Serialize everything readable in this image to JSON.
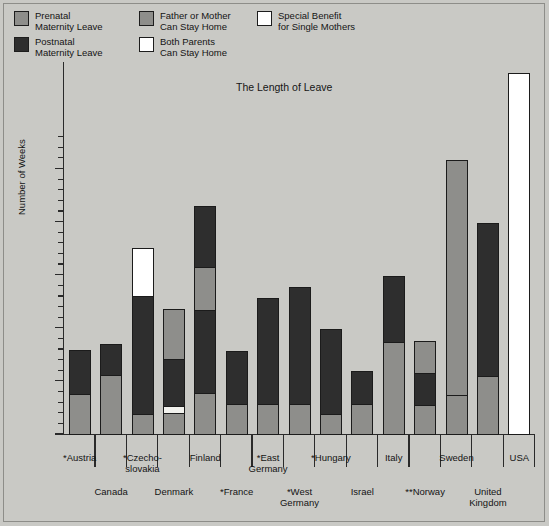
{
  "legend": {
    "items": [
      {
        "id": "prenatal",
        "label_line1": "Prenatal",
        "label_line2": "Maternity Leave",
        "color": "#8e8e8b"
      },
      {
        "id": "postnatal",
        "label_line1": "Postnatal",
        "label_line2": "Maternity Leave",
        "color": "#2e2e2e"
      },
      {
        "id": "father",
        "label_line1": "Father or Mother",
        "label_line2": "Can Stay Home",
        "color": "#8e8e8b"
      },
      {
        "id": "both",
        "label_line1": "Both Parents",
        "label_line2": "Can Stay Home",
        "color": "#ffffff"
      },
      {
        "id": "special",
        "label_line1": "Special Benefit",
        "label_line2": "for Single Mothers",
        "color": "#ffffff"
      }
    ]
  },
  "chart_data": {
    "type": "bar",
    "title": "The Length of Leave",
    "xlabel": "",
    "ylabel": "Number of Weeks",
    "ylim": [
      0,
      70
    ],
    "ytick_labels": [
      "0",
      "10",
      "20",
      "30",
      "40",
      "50"
    ],
    "ytick_values": [
      0,
      10,
      20,
      30,
      40,
      50
    ],
    "ytick_minor_step": 2,
    "grid": false,
    "legend_position": "top-left",
    "stacked": true,
    "series": [
      {
        "name": "Prenatal Maternity Leave",
        "key": "prenatal",
        "color": "#8e8e8b"
      },
      {
        "name": "Postnatal Maternity Leave",
        "key": "postnatal",
        "color": "#2e2e2e"
      },
      {
        "name": "Father or Mother Can Stay Home",
        "key": "father",
        "color": "#8e8e8b"
      },
      {
        "name": "Both Parents Can Stay Home",
        "key": "both",
        "color": "#f2f2ee"
      },
      {
        "name": "Special Benefit for Single Mothers",
        "key": "special",
        "color": "#ffffff"
      }
    ],
    "categories": [
      "*Austria",
      "Canada",
      "*Czecho-slovakia",
      "Denmark",
      "Finland",
      "*France",
      "*East Germany",
      "*West Germany",
      "*Hungary",
      "Israel",
      "**Norway",
      "Italy",
      "Sweden",
      "United Kingdom",
      "USA"
    ],
    "bars": [
      {
        "label_line1": "*Austria",
        "label_line2": "",
        "row": "up",
        "total": 15.8,
        "segments": [
          {
            "key": "prenatal",
            "from": 0,
            "to": 7.7
          },
          {
            "key": "postnatal",
            "from": 7.7,
            "to": 15.8
          }
        ]
      },
      {
        "label_line1": "Canada",
        "label_line2": "",
        "row": "down",
        "total": 17,
        "segments": [
          {
            "key": "prenatal",
            "from": 0,
            "to": 11.2
          },
          {
            "key": "postnatal",
            "from": 11.2,
            "to": 17
          }
        ]
      },
      {
        "label_line1": "*Czecho-",
        "label_line2": "slovakia",
        "row": "up",
        "total": 35,
        "segments": [
          {
            "key": "prenatal",
            "from": 0,
            "to": 3.8
          },
          {
            "key": "postnatal",
            "from": 3.8,
            "to": 26
          },
          {
            "key": "special",
            "from": 26,
            "to": 35
          }
        ]
      },
      {
        "label_line1": "Denmark",
        "label_line2": "",
        "row": "down",
        "total": 23.5,
        "segments": [
          {
            "key": "prenatal",
            "from": 0,
            "to": 4
          },
          {
            "key": "both",
            "from": 4,
            "to": 5.4
          },
          {
            "key": "postnatal",
            "from": 5.4,
            "to": 14.2
          },
          {
            "key": "father",
            "from": 14.2,
            "to": 23.5
          }
        ]
      },
      {
        "label_line1": "Finland",
        "label_line2": "",
        "row": "up",
        "total": 43,
        "segments": [
          {
            "key": "prenatal",
            "from": 0,
            "to": 7.8
          },
          {
            "key": "postnatal",
            "from": 7.8,
            "to": 23.5
          },
          {
            "key": "father",
            "from": 23.5,
            "to": 31.6
          },
          {
            "key": "postnatal",
            "from": 31.6,
            "to": 43
          }
        ]
      },
      {
        "label_line1": "*France",
        "label_line2": "",
        "row": "down",
        "total": 15.6,
        "segments": [
          {
            "key": "prenatal",
            "from": 0,
            "to": 5.8
          },
          {
            "key": "postnatal",
            "from": 5.8,
            "to": 15.6
          }
        ]
      },
      {
        "label_line1": "*East",
        "label_line2": "Germany",
        "row": "up",
        "total": 25.7,
        "segments": [
          {
            "key": "prenatal",
            "from": 0,
            "to": 5.7
          },
          {
            "key": "postnatal",
            "from": 5.7,
            "to": 25.7
          }
        ]
      },
      {
        "label_line1": "*West",
        "label_line2": "Germany",
        "row": "down",
        "total": 27.6,
        "segments": [
          {
            "key": "prenatal",
            "from": 0,
            "to": 5.7
          },
          {
            "key": "postnatal",
            "from": 5.7,
            "to": 27.6
          }
        ]
      },
      {
        "label_line1": "*Hungary",
        "label_line2": "",
        "row": "up",
        "total": 19.8,
        "segments": [
          {
            "key": "prenatal",
            "from": 0,
            "to": 3.9
          },
          {
            "key": "postnatal",
            "from": 3.9,
            "to": 19.8
          }
        ]
      },
      {
        "label_line1": "Israel",
        "label_line2": "",
        "row": "down",
        "total": 11.8,
        "segments": [
          {
            "key": "prenatal",
            "from": 0,
            "to": 5.7
          },
          {
            "key": "postnatal",
            "from": 5.7,
            "to": 11.8
          }
        ]
      },
      {
        "label_line1": "Italy",
        "label_line2": "",
        "row": "up",
        "total": 29.8,
        "segments": [
          {
            "key": "prenatal",
            "from": 0,
            "to": 17.4
          },
          {
            "key": "postnatal",
            "from": 17.4,
            "to": 29.8
          }
        ]
      },
      {
        "label_line1": "**Norway",
        "label_line2": "",
        "row": "down",
        "total": 17.5,
        "segments": [
          {
            "key": "prenatal",
            "from": 0,
            "to": 5.5
          },
          {
            "key": "postnatal",
            "from": 5.5,
            "to": 11.6
          },
          {
            "key": "father",
            "from": 11.6,
            "to": 17.5
          }
        ]
      },
      {
        "label_line1": "Sweden",
        "label_line2": "",
        "row": "up",
        "total": 51.6,
        "segments": [
          {
            "key": "prenatal",
            "from": 0,
            "to": 7.5
          },
          {
            "key": "father",
            "from": 7.5,
            "to": 51.6
          }
        ]
      },
      {
        "label_line1": "United",
        "label_line2": "Kingdom",
        "row": "down",
        "total": 39.8,
        "segments": [
          {
            "key": "prenatal",
            "from": 0,
            "to": 11
          },
          {
            "key": "postnatal",
            "from": 11,
            "to": 39.8
          }
        ]
      },
      {
        "label_line1": "USA",
        "label_line2": "",
        "row": "up",
        "total": 68,
        "segments": [
          {
            "key": "special",
            "from": 0,
            "to": 68
          }
        ]
      }
    ]
  }
}
